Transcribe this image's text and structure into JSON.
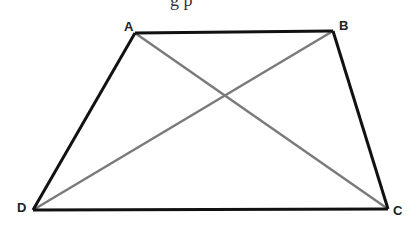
{
  "figure": {
    "top_cropped_text": "g   p",
    "vertices": {
      "A": {
        "label": "A",
        "x": 135,
        "y": 33
      },
      "B": {
        "label": "B",
        "x": 333,
        "y": 31
      },
      "C": {
        "label": "C",
        "x": 388,
        "y": 209
      },
      "D": {
        "label": "D",
        "x": 33,
        "y": 210
      }
    },
    "colors": {
      "sides": "#111111",
      "diagonals": "#7a7a7a"
    }
  }
}
